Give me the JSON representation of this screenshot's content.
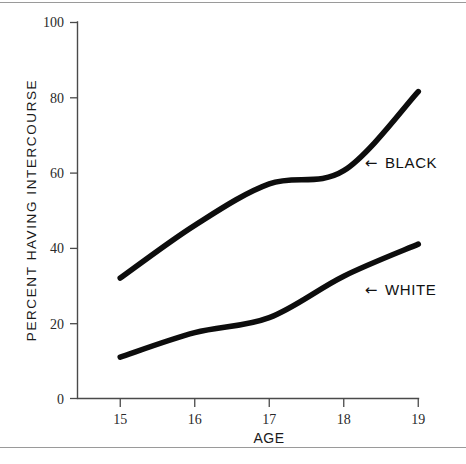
{
  "chart_data": {
    "type": "line",
    "title": "",
    "subtitle": "",
    "xlabel": "AGE",
    "ylabel": "PERCENT HAVING INTERCOURSE",
    "x": [
      15,
      16,
      17,
      18,
      19
    ],
    "xtick_labels": [
      "15",
      "16",
      "17",
      "18",
      "19"
    ],
    "ytick_labels": [
      "0",
      "20",
      "40",
      "60",
      "80",
      "100"
    ],
    "yticks": [
      0,
      20,
      40,
      60,
      80,
      100
    ],
    "xlim": [
      15,
      19
    ],
    "ylim": [
      0,
      100
    ],
    "grid": false,
    "legend_position": "inline-annotation",
    "series": [
      {
        "name": "BLACK",
        "values": [
          32,
          46,
          57,
          60.5,
          81.5
        ],
        "color": "#0d0d0d",
        "annotation": "← BLACK"
      },
      {
        "name": "WHITE",
        "values": [
          11,
          17.5,
          21.5,
          32.5,
          41
        ],
        "color": "#0d0d0d",
        "annotation": "← WHITE"
      }
    ],
    "annotations": [
      {
        "text": "BLACK",
        "arrow": "←",
        "x": 19,
        "y": 63
      },
      {
        "text": "WHITE",
        "arrow": "←",
        "x": 19,
        "y": 28
      }
    ]
  },
  "axes": {
    "y_title": "PERCENT HAVING INTERCOURSE",
    "x_title": "AGE",
    "y_ticks": [
      {
        "label": "100",
        "value": 100
      },
      {
        "label": "80",
        "value": 80
      },
      {
        "label": "60",
        "value": 60
      },
      {
        "label": "40",
        "value": 40
      },
      {
        "label": "20",
        "value": 20
      },
      {
        "label": "0",
        "value": 0
      }
    ],
    "x_ticks": [
      {
        "label": "15",
        "value": 15
      },
      {
        "label": "16",
        "value": 16
      },
      {
        "label": "17",
        "value": 17
      },
      {
        "label": "18",
        "value": 18
      },
      {
        "label": "19",
        "value": 19
      }
    ]
  },
  "labels": {
    "black_arrow": "←",
    "black_text": "BLACK",
    "white_arrow": "←",
    "white_text": "WHITE"
  }
}
